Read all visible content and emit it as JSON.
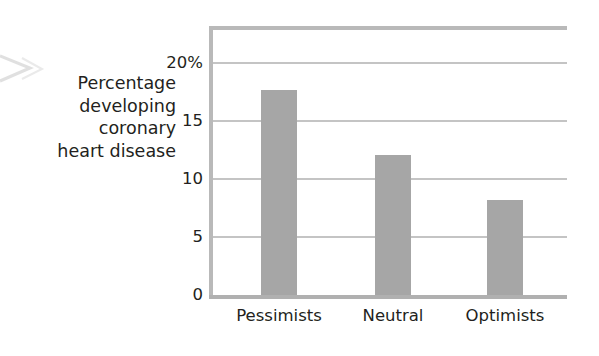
{
  "chart_data": {
    "type": "bar",
    "title": "",
    "subtitle": "",
    "xlabel": "",
    "ylabel": "Percentage\ndeveloping\ncoronary\nheart disease",
    "ylabel_lines": [
      "Percentage",
      "developing",
      "coronary",
      "heart disease"
    ],
    "categories": [
      "Pessimists",
      "Neutral",
      "Optimists"
    ],
    "values": [
      17.7,
      12.1,
      8.2
    ],
    "ylim": [
      0,
      23.2
    ],
    "yticks": [
      0,
      5,
      10,
      15,
      20
    ],
    "ytick_labels": [
      "0",
      "5",
      "10",
      "15",
      "20%"
    ],
    "grid": "horizontal",
    "legend": "none",
    "bar_color": "#a6a6a6",
    "grid_color": "#c4c4c4",
    "frame_color": "#b9b9b9",
    "text_color": "#231f20",
    "background": "#ffffff"
  },
  "axis": {
    "y_title_lines": [
      "Percentage",
      "developing",
      "coronary",
      "heart disease"
    ]
  }
}
